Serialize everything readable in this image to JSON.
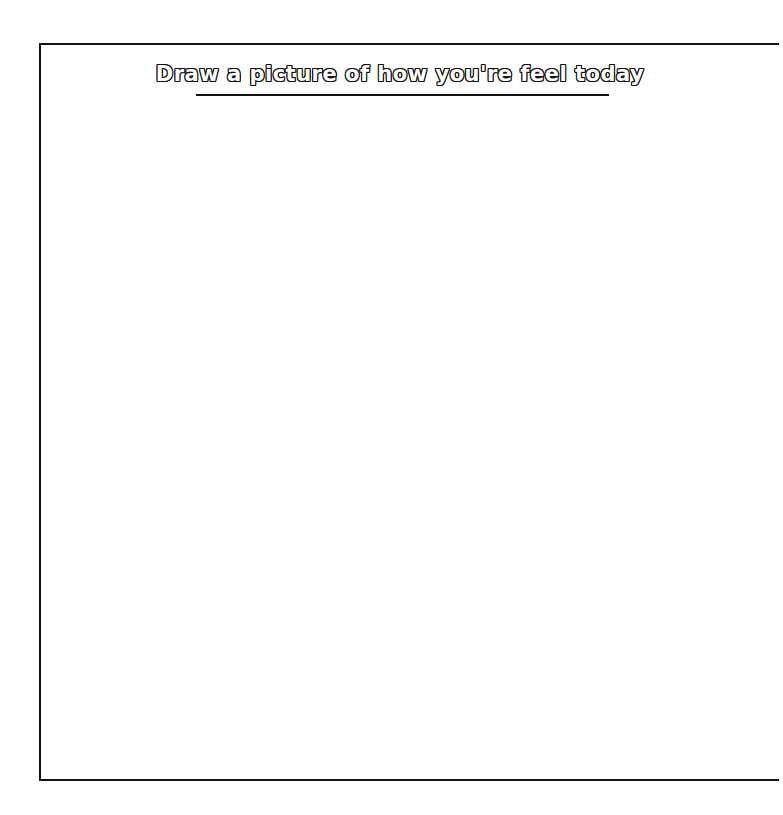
{
  "worksheet": {
    "title": "Draw a picture of how you're feel today",
    "drawing_area": {
      "content": ""
    }
  },
  "colors": {
    "border": "#111111",
    "background": "#ffffff",
    "title_fill": "#ffffff",
    "title_outline": "#111111"
  }
}
